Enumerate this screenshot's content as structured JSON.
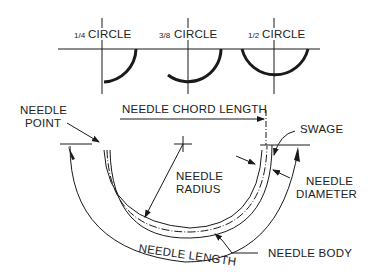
{
  "diagram": {
    "types": [
      {
        "fraction": "1/4",
        "label": "CIRCLE"
      },
      {
        "fraction": "3/8",
        "label": "CIRCLE"
      },
      {
        "fraction": "1/2",
        "label": "CIRCLE"
      }
    ],
    "labels": {
      "needle_point_1": "NEEDLE",
      "needle_point_2": "POINT",
      "chord_length": "NEEDLE CHORD LENGTH",
      "swage": "SWAGE",
      "radius_1": "NEEDLE",
      "radius_2": "RADIUS",
      "diameter_1": "NEEDLE",
      "diameter_2": "DIAMETER",
      "needle_length": "NEEDLE LENGTH",
      "needle_body": "NEEDLE BODY"
    },
    "colors": {
      "line": "#1a1a1a",
      "background": "#ffffff"
    }
  }
}
